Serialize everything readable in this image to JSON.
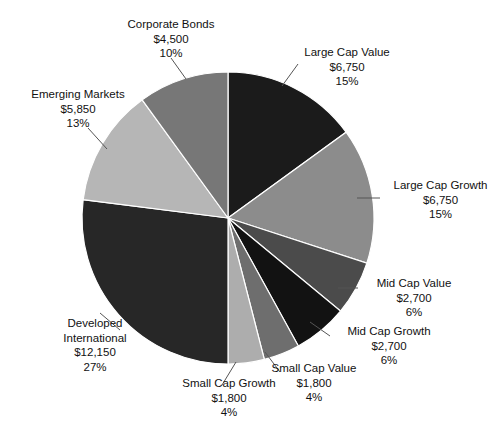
{
  "chart_data": {
    "type": "pie",
    "title": "",
    "subtitle": "",
    "xlabel": "",
    "ylabel": "",
    "legend_position": "none",
    "grid": false,
    "label_format": "name / amount / percent",
    "currency_symbol": "$",
    "total_value": 45000,
    "start_angle_deg": 0,
    "direction": "clockwise",
    "center": {
      "x": 228,
      "y": 218
    },
    "radius": 146,
    "categories": [
      "Large Cap Value",
      "Large Cap Growth",
      "Mid Cap Value",
      "Mid Cap Growth",
      "Small Cap Value",
      "Small Cap Growth",
      "Developed International",
      "Emerging Markets",
      "Corporate Bonds"
    ],
    "values": [
      6750,
      6750,
      2700,
      2700,
      1800,
      1800,
      12150,
      5850,
      4500
    ],
    "percents": [
      15,
      15,
      6,
      6,
      4,
      4,
      27,
      13,
      10
    ],
    "colors": [
      "#1b1b1b",
      "#8c8c8c",
      "#4b4b4b",
      "#121212",
      "#6e6e6e",
      "#adadad",
      "#272727",
      "#b6b6b6",
      "#777777"
    ],
    "slices": [
      {
        "name": "Large Cap Value",
        "value": 6750,
        "value_text": "$6,750",
        "percent": 15,
        "percent_text": "15%",
        "color": "#1b1b1b",
        "start_deg": 0,
        "end_deg": 54
      },
      {
        "name": "Large Cap Growth",
        "value": 6750,
        "value_text": "$6,750",
        "percent": 15,
        "percent_text": "15%",
        "color": "#8c8c8c",
        "start_deg": 54,
        "end_deg": 108
      },
      {
        "name": "Mid Cap Value",
        "value": 2700,
        "value_text": "$2,700",
        "percent": 6,
        "percent_text": "6%",
        "color": "#4b4b4b",
        "start_deg": 108,
        "end_deg": 129.6
      },
      {
        "name": "Mid Cap Growth",
        "value": 2700,
        "value_text": "$2,700",
        "percent": 6,
        "percent_text": "6%",
        "color": "#121212",
        "start_deg": 129.6,
        "end_deg": 151.2
      },
      {
        "name": "Small Cap Value",
        "value": 1800,
        "value_text": "$1,800",
        "percent": 4,
        "percent_text": "4%",
        "color": "#6e6e6e",
        "start_deg": 151.2,
        "end_deg": 165.6
      },
      {
        "name": "Small Cap Growth",
        "value": 1800,
        "value_text": "$1,800",
        "percent": 4,
        "percent_text": "4%",
        "color": "#adadad",
        "start_deg": 165.6,
        "end_deg": 180
      },
      {
        "name": "Developed International",
        "value": 12150,
        "value_text": "$12,150",
        "percent": 27,
        "percent_text": "27%",
        "color": "#272727",
        "start_deg": 180,
        "end_deg": 277.2
      },
      {
        "name": "Emerging Markets",
        "value": 5850,
        "value_text": "$5,850",
        "percent": 13,
        "percent_text": "13%",
        "color": "#b6b6b6",
        "start_deg": 277.2,
        "end_deg": 324
      },
      {
        "name": "Corporate Bonds",
        "value": 4500,
        "value_text": "$4,500",
        "percent": 10,
        "percent_text": "10%",
        "color": "#777777",
        "start_deg": 324,
        "end_deg": 360
      }
    ]
  },
  "labels": {
    "corporate_bonds": {
      "name": "Corporate Bonds",
      "value": "$4,500",
      "percent": "10%"
    },
    "emerging_markets": {
      "name": "Emerging Markets",
      "value": "$5,850",
      "percent": "13%"
    },
    "large_cap_value": {
      "name": "Large Cap Value",
      "value": "$6,750",
      "percent": "15%"
    },
    "large_cap_growth": {
      "name": "Large Cap Growth",
      "value": "$6,750",
      "percent": "15%"
    },
    "mid_cap_value": {
      "name": "Mid Cap Value",
      "value": "$2,700",
      "percent": "6%"
    },
    "mid_cap_growth": {
      "name": "Mid Cap Growth",
      "value": "$2,700",
      "percent": "6%"
    },
    "small_cap_value": {
      "name": "Small Cap Value",
      "value": "$1,800",
      "percent": "4%"
    },
    "small_cap_growth": {
      "name": "Small Cap Growth",
      "value": "$1,800",
      "percent": "4%"
    },
    "developed_international": {
      "name_line1": "Developed",
      "name_line2": "International",
      "value": "$12,150",
      "percent": "27%"
    }
  },
  "leader_lines": [
    {
      "name": "corporate-bonds-leader",
      "x1": 171,
      "y1": 58,
      "x2": 186,
      "y2": 79
    },
    {
      "name": "emerging-markets-leader",
      "x1": 88,
      "y1": 128,
      "x2": 107,
      "y2": 149
    },
    {
      "name": "large-cap-value-leader",
      "x1": 282,
      "y1": 86,
      "x2": 298,
      "y2": 64
    },
    {
      "name": "large-cap-growth-leader",
      "x1": 357,
      "y1": 198,
      "x2": 380,
      "y2": 198
    },
    {
      "name": "mid-cap-value-leader",
      "x1": 338,
      "y1": 288,
      "x2": 358,
      "y2": 288
    },
    {
      "name": "mid-cap-growth-leader",
      "x1": 310,
      "y1": 322,
      "x2": 330,
      "y2": 336
    },
    {
      "name": "small-cap-value-leader",
      "x1": 265,
      "y1": 352,
      "x2": 280,
      "y2": 372
    },
    {
      "name": "small-cap-growth-leader",
      "x1": 236,
      "y1": 362,
      "x2": 222,
      "y2": 385
    },
    {
      "name": "developed-international-leader",
      "x1": 120,
      "y1": 330,
      "x2": 100,
      "y2": 313
    }
  ]
}
